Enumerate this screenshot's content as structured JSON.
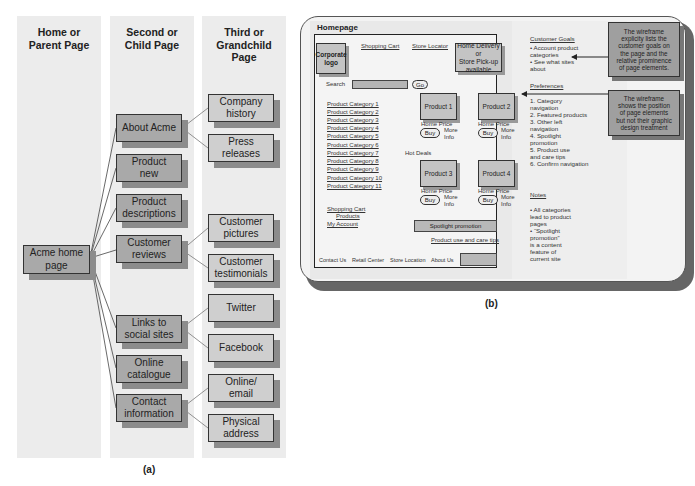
{
  "panel_a": {
    "caption": "(a)",
    "columns": [
      {
        "header_line1": "Home or",
        "header_line2": "Parent Page",
        "header_line3": ""
      },
      {
        "header_line1": "Second or",
        "header_line2": "Child Page",
        "header_line3": ""
      },
      {
        "header_line1": "Third or",
        "header_line2": "Grandchild",
        "header_line3": "Page"
      }
    ],
    "home": {
      "line1": "Acme home",
      "line2": "page"
    },
    "second_level": [
      {
        "line1": "About Acme",
        "line2": ""
      },
      {
        "line1": "Product",
        "line2": "new"
      },
      {
        "line1": "Product",
        "line2": "descriptions"
      },
      {
        "line1": "Customer",
        "line2": "reviews"
      },
      {
        "line1": "Links to",
        "line2": "social sites"
      },
      {
        "line1": "Online",
        "line2": "catalogue"
      },
      {
        "line1": "Contact",
        "line2": "information"
      }
    ],
    "third_level": [
      {
        "line1": "Company",
        "line2": "history",
        "parent": "About Acme"
      },
      {
        "line1": "Press",
        "line2": "releases",
        "parent": "About Acme"
      },
      {
        "line1": "Customer",
        "line2": "pictures",
        "parent": "Customer reviews"
      },
      {
        "line1": "Customer",
        "line2": "testimonials",
        "parent": "Customer reviews"
      },
      {
        "line1": "Twitter",
        "line2": "",
        "parent": "Links to social sites"
      },
      {
        "line1": "Facebook",
        "line2": "",
        "parent": "Links to social sites"
      },
      {
        "line1": "Online/",
        "line2": "email",
        "parent": "Contact information"
      },
      {
        "line1": "Physical",
        "line2": "address",
        "parent": "Contact information"
      }
    ]
  },
  "panel_b": {
    "caption": "(b)",
    "title": "Homepage",
    "logo": {
      "line1": "Corporate",
      "line2": "logo"
    },
    "top_links": [
      "Shopping Cart",
      "Store Locator"
    ],
    "delivery_box": {
      "line1": "Home Delivery or",
      "line2": "Store Pick-up",
      "line3": "available"
    },
    "search_label": "Search",
    "go_label": "Go",
    "categories": [
      "Product Category 1",
      "Product Category 2",
      "Product Category 3",
      "Product Category 4",
      "Product Category 5",
      "Product Category 6",
      "Product Category 7",
      "Product Category 8",
      "Product Category 9",
      "Product Category 10",
      "Product Category 11"
    ],
    "products": [
      {
        "name": "Product 1",
        "price": "Home Price",
        "buy": "Buy",
        "more1": "More",
        "more2": "Info"
      },
      {
        "name": "Product 2",
        "price": "Home Price",
        "buy": "Buy",
        "more1": "More",
        "more2": "Info"
      },
      {
        "name": "Product 3",
        "price": "Home Price",
        "buy": "Buy",
        "more1": "More",
        "more2": "Info"
      },
      {
        "name": "Product 4",
        "price": "Home Price",
        "buy": "Buy",
        "more1": "More",
        "more2": "Info"
      }
    ],
    "hot_deals": "Hot Deals",
    "left_links": [
      "Shopping Cart",
      "Products",
      "My Account"
    ],
    "spotlight": "Spotlight promotion",
    "care_tips": "Product use and care tips",
    "footer_links": [
      "Contact Us",
      "Retail Center",
      "Store Location",
      "About Us"
    ],
    "side": {
      "goals_heading": "Customer Goals",
      "goals": [
        "•  Account product",
        "    categories",
        "•  See what sites",
        "    about"
      ],
      "prefs_heading": "Preferences",
      "prefs": [
        "1. Category",
        "    navigation",
        "2. Featured products",
        "3. Other left",
        "    navigation",
        "4. Spotlight",
        "    promotion",
        "5. Product use",
        "    and care tips",
        "6. Confirm navigation"
      ],
      "notes_heading": "Notes",
      "notes": [
        "•  All categories",
        "    lead to product",
        "    pages",
        "• “Spotlight",
        "    promotion”",
        "    is a content",
        "    feature of",
        "    current site"
      ]
    },
    "annotations": [
      {
        "lines": [
          "The wireframe",
          "explicity lists the",
          "customer goals on",
          "the page and the",
          "relative prominence",
          "of page elements."
        ]
      },
      {
        "lines": [
          "The wireframe",
          "shows the position",
          "of page elements",
          "but not their graphic",
          "design treatment"
        ]
      }
    ]
  }
}
